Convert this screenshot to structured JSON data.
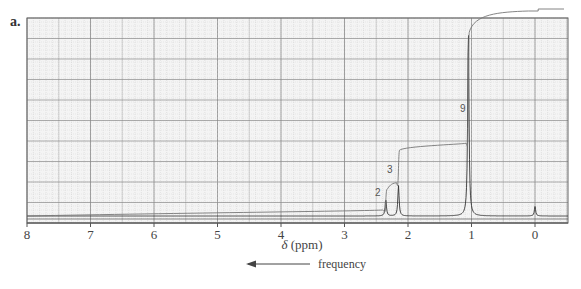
{
  "panel_label": "a.",
  "chart_data": {
    "type": "line",
    "title": "",
    "subtitle": "1H NMR spectrum",
    "xlabel": "δ (ppm)",
    "ylabel": "",
    "xlim": [
      8,
      -0.5
    ],
    "x_direction": "reversed",
    "x_ticks": [
      8,
      7,
      6,
      5,
      4,
      3,
      2,
      1,
      0
    ],
    "x_tick_labels": [
      "8",
      "7",
      "6",
      "5",
      "4",
      "3",
      "2",
      "1",
      "0"
    ],
    "grid": true,
    "legend": null,
    "annotations": [
      {
        "text": "frequency",
        "type": "arrow",
        "direction": "left"
      }
    ],
    "series": [
      {
        "name": "spectrum",
        "peaks": [
          {
            "ppm": 2.35,
            "relative_height": 0.09,
            "multiplicity": "singlet"
          },
          {
            "ppm": 2.15,
            "relative_height": 0.16,
            "multiplicity": "singlet"
          },
          {
            "ppm": 1.05,
            "relative_height": 1.0,
            "multiplicity": "singlet"
          },
          {
            "ppm": 0.0,
            "relative_height": 0.05,
            "multiplicity": "singlet",
            "note": "TMS reference"
          }
        ]
      },
      {
        "name": "integration",
        "steps": [
          {
            "ppm": 2.35,
            "integral": 2,
            "label": "2"
          },
          {
            "ppm": 2.15,
            "integral": 3,
            "label": "3"
          },
          {
            "ppm": 1.05,
            "integral": 9,
            "label": "9"
          }
        ]
      }
    ]
  },
  "axis": {
    "xlabel_prefix": "δ",
    "xlabel_unit": "(ppm)",
    "tick_labels": [
      "8",
      "7",
      "6",
      "5",
      "4",
      "3",
      "2",
      "1",
      "0"
    ]
  },
  "arrow": {
    "label": "frequency"
  },
  "integration_labels": {
    "peak_a": "2",
    "peak_b": "3",
    "peak_c": "9"
  },
  "colors": {
    "grid_major": "#8a8a8a",
    "grid_minor": "#cfcfcf",
    "trace": "#333333",
    "integral": "#777777"
  }
}
